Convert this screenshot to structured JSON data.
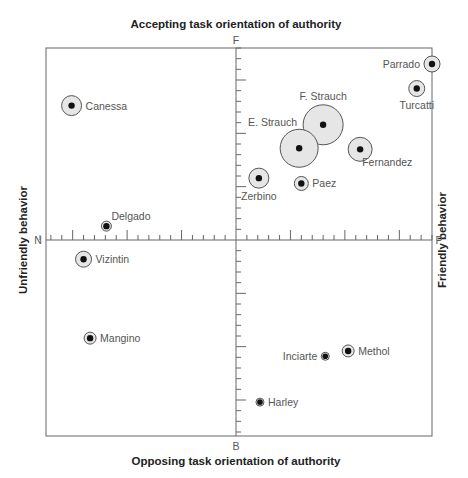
{
  "chart_data": {
    "type": "scatter",
    "title_top": "Accepting task orientation of authority",
    "title_bottom": "Opposing task orientation of authority",
    "title_left": "Unfriendly behavior",
    "title_right": "Friendly behavior",
    "poles": {
      "top": "F",
      "bottom": "B",
      "left": "N",
      "right": "P"
    },
    "xlim": [
      -18,
      18
    ],
    "ylim": [
      -18,
      18
    ],
    "grid": false,
    "legend": null,
    "points": [
      {
        "name": "Parrado",
        "x": 18.0,
        "y": 16.5,
        "size": 8,
        "label_side": "left"
      },
      {
        "name": "Turcatti",
        "x": 16.6,
        "y": 14.2,
        "size": 8,
        "label_side": "below"
      },
      {
        "name": "Canessa",
        "x": -15.1,
        "y": 12.6,
        "size": 10,
        "label_side": "right"
      },
      {
        "name": "F. Strauch",
        "x": 8.0,
        "y": 10.8,
        "size": 20,
        "label_side": "above"
      },
      {
        "name": "E. Strauch",
        "x": 5.8,
        "y": 8.6,
        "size": 19,
        "label_side": "above-left"
      },
      {
        "name": "Fernandez",
        "x": 11.4,
        "y": 8.5,
        "size": 12,
        "label_side": "below-right"
      },
      {
        "name": "Zerbino",
        "x": 2.1,
        "y": 5.8,
        "size": 10,
        "label_side": "below"
      },
      {
        "name": "Paez",
        "x": 6.0,
        "y": 5.3,
        "size": 7,
        "label_side": "right"
      },
      {
        "name": "Delgado",
        "x": -11.9,
        "y": 1.3,
        "size": 5,
        "label_side": "above-right"
      },
      {
        "name": "Vizintin",
        "x": -14.0,
        "y": -1.8,
        "size": 8,
        "label_side": "right"
      },
      {
        "name": "Mangino",
        "x": -13.4,
        "y": -9.2,
        "size": 6,
        "label_side": "right"
      },
      {
        "name": "Methol",
        "x": 10.3,
        "y": -10.4,
        "size": 6,
        "label_side": "right"
      },
      {
        "name": "Inciarte",
        "x": 8.2,
        "y": -10.9,
        "size": 4,
        "label_side": "left"
      },
      {
        "name": "Harley",
        "x": 2.2,
        "y": -15.2,
        "size": 4,
        "label_side": "right"
      }
    ]
  }
}
